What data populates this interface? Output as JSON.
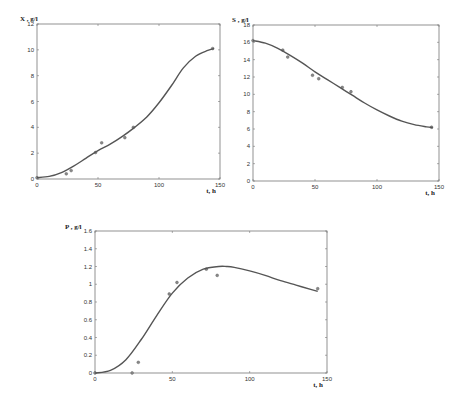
{
  "chart_data": [
    {
      "type": "scatter",
      "title": "",
      "xlabel": "t, h",
      "ylabel": "X , g/l",
      "xlim": [
        0,
        150
      ],
      "ylim": [
        0,
        12
      ],
      "xticks": [
        0,
        50,
        100,
        150
      ],
      "yticks": [
        0,
        2,
        4,
        6,
        8,
        10,
        12
      ],
      "grid": false,
      "series": [
        {
          "name": "experimental",
          "kind": "scatter",
          "x": [
            0,
            24,
            28,
            48,
            53,
            72,
            79,
            144
          ],
          "y": [
            0.1,
            0.4,
            0.65,
            2.05,
            2.8,
            3.2,
            4.0,
            10.1
          ]
        },
        {
          "name": "model",
          "kind": "line",
          "x": [
            0,
            10,
            20,
            30,
            40,
            50,
            60,
            70,
            80,
            90,
            100,
            110,
            120,
            130,
            140,
            145
          ],
          "y": [
            0.1,
            0.2,
            0.5,
            1.0,
            1.6,
            2.2,
            2.7,
            3.3,
            4.0,
            4.8,
            5.9,
            7.2,
            8.6,
            9.5,
            9.95,
            10.1
          ]
        }
      ]
    },
    {
      "type": "scatter",
      "title": "",
      "xlabel": "t, h",
      "ylabel": "S , g/l",
      "xlim": [
        0,
        150
      ],
      "ylim": [
        0,
        18
      ],
      "xticks": [
        0,
        50,
        100,
        150
      ],
      "yticks": [
        0,
        2,
        4,
        6,
        8,
        10,
        12,
        14,
        16,
        18
      ],
      "grid": false,
      "series": [
        {
          "name": "experimental",
          "kind": "scatter",
          "x": [
            0,
            24,
            28,
            48,
            53,
            72,
            79,
            144
          ],
          "y": [
            16.2,
            15.1,
            14.3,
            12.2,
            11.8,
            10.8,
            10.3,
            6.2
          ]
        },
        {
          "name": "model",
          "kind": "line",
          "x": [
            0,
            10,
            20,
            30,
            40,
            50,
            60,
            70,
            80,
            90,
            100,
            110,
            120,
            130,
            140,
            145
          ],
          "y": [
            16.2,
            15.9,
            15.3,
            14.5,
            13.6,
            12.6,
            11.7,
            10.8,
            9.9,
            9.0,
            8.2,
            7.5,
            6.9,
            6.5,
            6.25,
            6.15
          ]
        }
      ]
    },
    {
      "type": "scatter",
      "title": "",
      "xlabel": "t, h",
      "ylabel": "P , g/l",
      "xlim": [
        0,
        150
      ],
      "ylim": [
        0,
        1.6
      ],
      "xticks": [
        0,
        50,
        100,
        150
      ],
      "yticks": [
        0,
        0.2,
        0.4,
        0.6,
        0.8,
        1,
        1.2,
        1.4,
        1.6
      ],
      "grid": false,
      "series": [
        {
          "name": "experimental",
          "kind": "scatter",
          "x": [
            0,
            24,
            28,
            48,
            53,
            72,
            79,
            144
          ],
          "y": [
            0,
            0,
            0.12,
            0.89,
            1.02,
            1.17,
            1.1,
            0.95
          ]
        },
        {
          "name": "model",
          "kind": "line",
          "x": [
            0,
            10,
            20,
            30,
            40,
            50,
            60,
            70,
            80,
            85,
            90,
            100,
            110,
            120,
            130,
            140,
            144
          ],
          "y": [
            0,
            0.03,
            0.15,
            0.38,
            0.65,
            0.9,
            1.07,
            1.17,
            1.2,
            1.2,
            1.19,
            1.15,
            1.1,
            1.04,
            0.99,
            0.94,
            0.92
          ]
        }
      ]
    }
  ],
  "plots": [
    {
      "ylabel": "X , g/l",
      "xlabel": "t, h",
      "box": [
        37,
        24,
        220,
        179
      ],
      "label_pos": [
        20,
        21
      ]
    },
    {
      "ylabel": "S , g/l",
      "xlabel": "t, h",
      "box": [
        253,
        25,
        439,
        181
      ],
      "label_pos": [
        232,
        22
      ]
    },
    {
      "ylabel": "P , g/l",
      "xlabel": "t, h",
      "box": [
        95,
        231,
        327,
        373
      ],
      "label_pos": [
        65,
        229
      ]
    }
  ]
}
